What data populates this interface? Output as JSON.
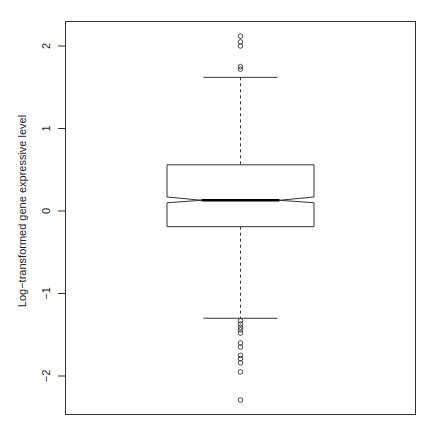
{
  "chart_data": {
    "type": "boxplot",
    "title": "",
    "xlabel": "",
    "ylabel": "Log−transformed gene expressive level",
    "ylim": [
      -2.45,
      2.3
    ],
    "yticks": [
      -2,
      -1,
      0,
      1,
      2
    ],
    "ytick_labels": [
      "−2",
      "−1",
      "0",
      "1",
      "2"
    ],
    "grid": false,
    "notched": true,
    "series": [
      {
        "name": "",
        "q1": -0.19,
        "median": 0.13,
        "q3": 0.56,
        "notch_low": 0.1,
        "notch_high": 0.17,
        "whisker_low": -1.3,
        "whisker_high": 1.62,
        "outliers": [
          2.12,
          2.05,
          2.0,
          1.75,
          1.72,
          -1.33,
          -1.37,
          -1.41,
          -1.44,
          -1.48,
          -1.6,
          -1.65,
          -1.75,
          -1.79,
          -1.84,
          -1.95,
          -2.29
        ]
      }
    ]
  },
  "colors": {
    "frame": "#333333",
    "box": "#333333",
    "median": "#000000",
    "background": "#ffffff"
  }
}
